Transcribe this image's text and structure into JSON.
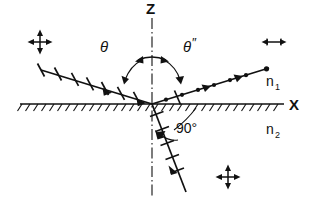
{
  "figure": {
    "type": "optics-ray-diagram",
    "background_color": "#ffffff",
    "ink_color": "#111111"
  },
  "axes": {
    "vertical": {
      "label": "Z",
      "style": "dash-dot",
      "orientation": "vertical",
      "x": 152,
      "y_top": 18,
      "y_bottom": 196
    },
    "horizontal": {
      "label": "X",
      "style": "solid-with-hatching",
      "orientation": "horizontal",
      "y": 104,
      "x_left": 20,
      "x_right": 284
    }
  },
  "media": {
    "upper": {
      "label": "n",
      "subscript": "1",
      "x": 272,
      "y": 82
    },
    "lower": {
      "label": "n",
      "subscript": "2",
      "x": 272,
      "y": 130
    }
  },
  "angles": {
    "incident": {
      "label": "θ",
      "x": 110,
      "y": 45
    },
    "reflected": {
      "label": "θ",
      "prime": "″",
      "x": 178,
      "y": 45
    },
    "between_reflected_and_refracted": {
      "label": "90°",
      "x": 178,
      "y": 132
    }
  },
  "rays": {
    "incident": {
      "name": "incident-ray",
      "polarization": "in-plane (ticks)",
      "from": [
        41,
        70
      ],
      "to": [
        152,
        104
      ],
      "tick_count": 7,
      "arrow_direction": "toward-origin"
    },
    "reflected": {
      "name": "reflected-ray",
      "polarization": "perpendicular-to-plane (dots)",
      "from": [
        152,
        104
      ],
      "to": [
        269,
        68
      ],
      "dot_count": 7,
      "arrow_direction": "away-from-origin"
    },
    "refracted": {
      "name": "refracted-ray",
      "polarization": "in-plane (ticks)",
      "from": [
        152,
        104
      ],
      "to": [
        184,
        190
      ],
      "tick_count": 5,
      "arrow_direction": "away-from-origin"
    }
  },
  "polarization_markers": [
    {
      "name": "unpolarized-marker-upper-left",
      "type": "cross-double-arrow",
      "x": 40,
      "y": 42
    },
    {
      "name": "horizontal-polarization-marker-upper-right",
      "type": "horizontal-double-arrow",
      "x": 274,
      "y": 42
    },
    {
      "name": "unpolarized-marker-lower",
      "type": "cross-double-arrow",
      "x": 228,
      "y": 177
    }
  ]
}
